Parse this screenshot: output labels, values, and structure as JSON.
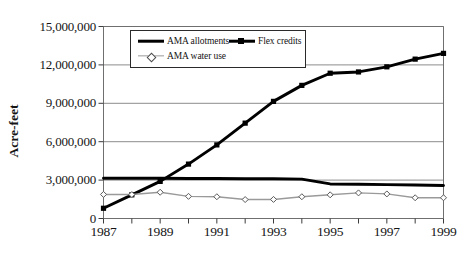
{
  "chart_data": {
    "type": "line",
    "title": "",
    "xlabel": "",
    "ylabel": "Acre-feet",
    "xlim": [
      1987,
      1999
    ],
    "ylim": [
      0,
      15000000
    ],
    "grid": true,
    "legend_position": "top-left-inside",
    "x": [
      1987,
      1988,
      1989,
      1990,
      1991,
      1992,
      1993,
      1994,
      1995,
      1996,
      1997,
      1998,
      1999
    ],
    "xtick_labels": [
      "1987",
      "1989",
      "1991",
      "1993",
      "1995",
      "1997",
      "1999"
    ],
    "xtick_values": [
      1987,
      1989,
      1991,
      1993,
      1995,
      1997,
      1999
    ],
    "ytick_labels": [
      "0",
      "3,000,000",
      "6,000,000",
      "9,000,000",
      "12,000,000",
      "15,000,000"
    ],
    "ytick_values": [
      0,
      3000000,
      6000000,
      9000000,
      12000000,
      15000000
    ],
    "series": [
      {
        "name": "AMA allotments",
        "color": "#000000",
        "marker": "none",
        "line_width": "thick",
        "values": [
          3150000,
          3150000,
          3140000,
          3130000,
          3120000,
          3110000,
          3100000,
          3080000,
          2700000,
          2680000,
          2650000,
          2620000,
          2580000
        ]
      },
      {
        "name": "Flex credits",
        "color": "#000000",
        "marker": "square",
        "line_width": "thick",
        "values": [
          800000,
          1850000,
          2900000,
          4250000,
          5750000,
          7450000,
          9150000,
          10400000,
          11350000,
          11450000,
          11850000,
          12450000,
          12900000
        ]
      },
      {
        "name": "AMA water use",
        "color": "#9a9a9a",
        "marker": "diamond",
        "line_width": "thin",
        "values": [
          1880000,
          1870000,
          2050000,
          1730000,
          1700000,
          1480000,
          1490000,
          1700000,
          1850000,
          2000000,
          1920000,
          1620000,
          1620000
        ]
      }
    ]
  },
  "axis": {
    "y_title": "Acre-feet"
  },
  "legend": {
    "items": [
      {
        "label": "AMA allotments"
      },
      {
        "label": "Flex credits"
      },
      {
        "label": "AMA water use"
      }
    ]
  }
}
